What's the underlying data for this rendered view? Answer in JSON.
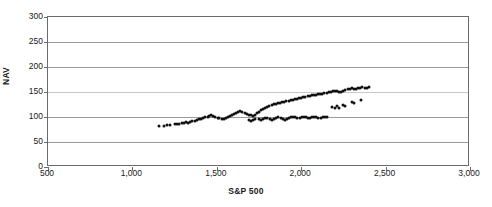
{
  "chart_data": {
    "type": "scatter",
    "title": "",
    "xlabel": "S&P 500",
    "ylabel": "NAV",
    "xlim": [
      500,
      3000
    ],
    "ylim": [
      0,
      300
    ],
    "xticks": [
      500,
      1000,
      1500,
      2000,
      2500,
      3000
    ],
    "xticklabels": [
      "500",
      "1,000",
      "1,500",
      "2,000",
      "2,500",
      "3,000"
    ],
    "yticks": [
      0,
      50,
      100,
      150,
      200,
      250,
      300
    ],
    "yticklabels": [
      "0",
      "50",
      "100",
      "150",
      "200",
      "250",
      "300"
    ],
    "grid": "horizontal",
    "legend": "none",
    "marker_color": "#111111",
    "series": [
      {
        "name": "NAV vs S&P 500",
        "points": [
          [
            1155,
            82
          ],
          [
            1185,
            83
          ],
          [
            1205,
            84
          ],
          [
            1225,
            85
          ],
          [
            1250,
            86
          ],
          [
            1265,
            87
          ],
          [
            1278,
            86
          ],
          [
            1292,
            88
          ],
          [
            1305,
            89
          ],
          [
            1318,
            90
          ],
          [
            1330,
            89
          ],
          [
            1342,
            91
          ],
          [
            1355,
            92
          ],
          [
            1368,
            93
          ],
          [
            1380,
            94
          ],
          [
            1395,
            96
          ],
          [
            1408,
            97
          ],
          [
            1420,
            99
          ],
          [
            1432,
            100
          ],
          [
            1445,
            101
          ],
          [
            1455,
            103
          ],
          [
            1468,
            104
          ],
          [
            1480,
            102
          ],
          [
            1492,
            100
          ],
          [
            1505,
            99
          ],
          [
            1515,
            98
          ],
          [
            1528,
            97
          ],
          [
            1540,
            96
          ],
          [
            1552,
            98
          ],
          [
            1565,
            100
          ],
          [
            1578,
            102
          ],
          [
            1590,
            104
          ],
          [
            1602,
            106
          ],
          [
            1615,
            108
          ],
          [
            1628,
            110
          ],
          [
            1640,
            112
          ],
          [
            1652,
            111
          ],
          [
            1665,
            109
          ],
          [
            1678,
            107
          ],
          [
            1690,
            105
          ],
          [
            1702,
            104
          ],
          [
            1712,
            103
          ],
          [
            1725,
            105
          ],
          [
            1738,
            108
          ],
          [
            1750,
            111
          ],
          [
            1762,
            114
          ],
          [
            1775,
            117
          ],
          [
            1788,
            119
          ],
          [
            1800,
            121
          ],
          [
            1812,
            123
          ],
          [
            1825,
            124
          ],
          [
            1838,
            126
          ],
          [
            1850,
            127
          ],
          [
            1862,
            128
          ],
          [
            1875,
            129
          ],
          [
            1888,
            130
          ],
          [
            1900,
            131
          ],
          [
            1912,
            132
          ],
          [
            1925,
            133
          ],
          [
            1938,
            134
          ],
          [
            1950,
            135
          ],
          [
            1962,
            136
          ],
          [
            1975,
            137
          ],
          [
            1988,
            138
          ],
          [
            2000,
            139
          ],
          [
            2012,
            140
          ],
          [
            2025,
            141
          ],
          [
            2038,
            142
          ],
          [
            2050,
            143
          ],
          [
            2062,
            144
          ],
          [
            2075,
            144
          ],
          [
            2088,
            145
          ],
          [
            2100,
            146
          ],
          [
            2112,
            146
          ],
          [
            2125,
            147
          ],
          [
            2138,
            148
          ],
          [
            2150,
            149
          ],
          [
            2162,
            150
          ],
          [
            2175,
            151
          ],
          [
            2188,
            152
          ],
          [
            2200,
            153
          ],
          [
            2212,
            152
          ],
          [
            2225,
            150
          ],
          [
            2238,
            151
          ],
          [
            2250,
            153
          ],
          [
            2262,
            155
          ],
          [
            2275,
            156
          ],
          [
            2288,
            157
          ],
          [
            2300,
            158
          ],
          [
            2312,
            157
          ],
          [
            2325,
            156
          ],
          [
            2338,
            158
          ],
          [
            2350,
            159
          ],
          [
            2362,
            160
          ],
          [
            2375,
            159
          ],
          [
            2388,
            158
          ],
          [
            2400,
            160
          ],
          [
            1800,
            98
          ],
          [
            1815,
            96
          ],
          [
            1828,
            95
          ],
          [
            1840,
            97
          ],
          [
            1852,
            99
          ],
          [
            1865,
            100
          ],
          [
            1878,
            98
          ],
          [
            1890,
            96
          ],
          [
            1902,
            95
          ],
          [
            1915,
            97
          ],
          [
            1928,
            99
          ],
          [
            1940,
            100
          ],
          [
            1952,
            101
          ],
          [
            1965,
            100
          ],
          [
            1978,
            99
          ],
          [
            1990,
            98
          ],
          [
            2002,
            100
          ],
          [
            2015,
            101
          ],
          [
            2028,
            100
          ],
          [
            2040,
            99
          ],
          [
            2052,
            98
          ],
          [
            2065,
            100
          ],
          [
            2078,
            101
          ],
          [
            2090,
            100
          ],
          [
            2102,
            99
          ],
          [
            2115,
            98
          ],
          [
            2128,
            100
          ],
          [
            2140,
            101
          ],
          [
            2152,
            100
          ],
          [
            2185,
            120
          ],
          [
            2198,
            118
          ],
          [
            2212,
            122
          ],
          [
            2225,
            119
          ],
          [
            2250,
            125
          ],
          [
            2262,
            123
          ],
          [
            2300,
            130
          ],
          [
            2312,
            128
          ],
          [
            2352,
            134
          ],
          [
            1748,
            96
          ],
          [
            1760,
            95
          ],
          [
            1772,
            97
          ],
          [
            1785,
            99
          ],
          [
            1690,
            94
          ],
          [
            1702,
            93
          ],
          [
            1715,
            95
          ],
          [
            1728,
            97
          ]
        ]
      }
    ]
  }
}
